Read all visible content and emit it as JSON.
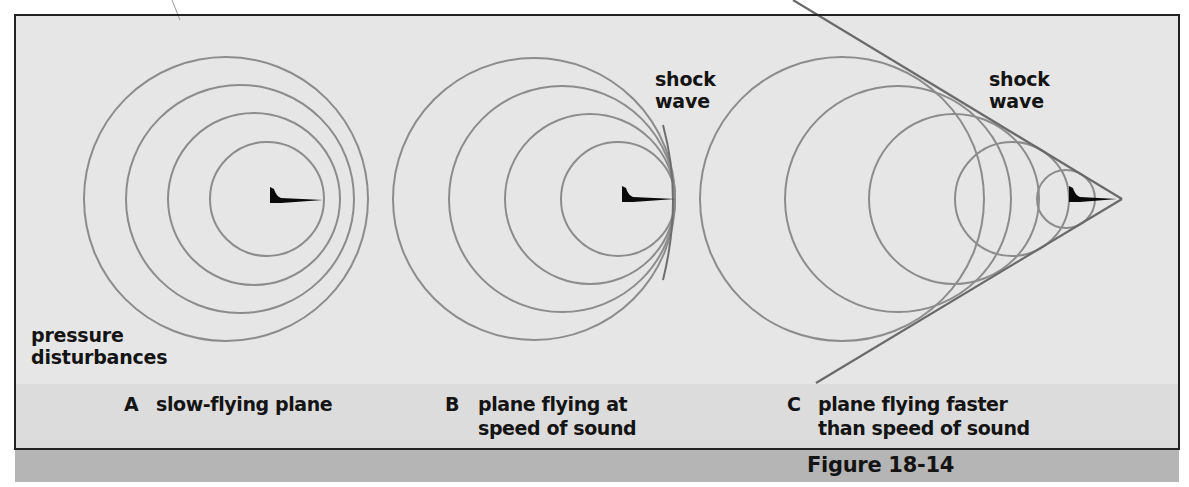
{
  "figure": {
    "number_label": "Figure 18-14",
    "colors": {
      "panel_background": "#e6e6e6",
      "caption_band": "#dcdcdc",
      "figure_bar": "#b5b5b5",
      "frame_border": "#222222",
      "wave_stroke": "#8c8c8c",
      "cone_stroke": "#6a6a6a",
      "plane_fill": "#0a0a0a",
      "text": "#141414"
    },
    "panels": [
      {
        "id": "A",
        "letter": "A",
        "caption": "slow-flying plane",
        "callouts": [
          "pressure",
          "disturbances"
        ],
        "plane": {
          "tail_x": 270,
          "nose_x": 323,
          "y": 200
        },
        "circles": [
          {
            "cx": 226,
            "cy": 199,
            "r": 142
          },
          {
            "cx": 240,
            "cy": 199,
            "r": 114
          },
          {
            "cx": 254,
            "cy": 199,
            "r": 86
          },
          {
            "cx": 267,
            "cy": 199,
            "r": 57
          }
        ]
      },
      {
        "id": "B",
        "letter": "B",
        "caption": "plane flying at\nspeed of sound",
        "callouts": [
          "shock",
          "wave"
        ],
        "plane": {
          "tail_x": 622,
          "nose_x": 675,
          "y": 199
        },
        "circles": [
          {
            "cx": 534,
            "cy": 199,
            "r": 141
          },
          {
            "cx": 562,
            "cy": 199,
            "r": 113
          },
          {
            "cx": 590,
            "cy": 199,
            "r": 85
          },
          {
            "cx": 618,
            "cy": 199,
            "r": 57
          }
        ]
      },
      {
        "id": "C",
        "letter": "C",
        "caption": "plane flying faster\nthan speed of sound",
        "callouts": [
          "shock",
          "wave"
        ],
        "plane": {
          "tail_x": 1069,
          "nose_x": 1117,
          "y": 199
        },
        "circles": [
          {
            "cx": 842,
            "cy": 199,
            "r": 142
          },
          {
            "cx": 898,
            "cy": 199,
            "r": 113
          },
          {
            "cx": 954,
            "cy": 199,
            "r": 85
          },
          {
            "cx": 1012,
            "cy": 199,
            "r": 57
          },
          {
            "cx": 1066,
            "cy": 199,
            "r": 29
          }
        ],
        "cone": {
          "apex": [
            1122,
            199
          ],
          "upper_end": [
            793,
            0
          ],
          "lower_end": [
            816,
            383
          ]
        }
      }
    ]
  }
}
